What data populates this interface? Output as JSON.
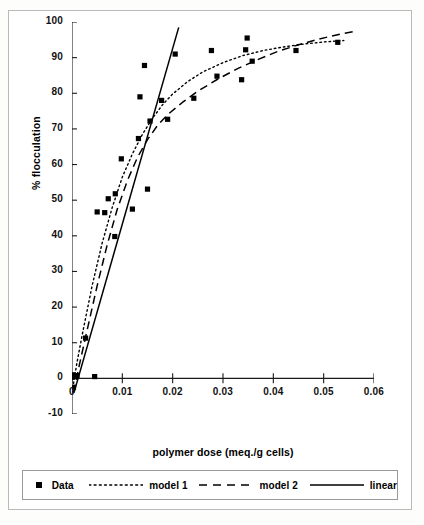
{
  "chart_data": {
    "type": "scatter",
    "title": "",
    "xlabel": "polymer dose (meq./g cells)",
    "ylabel": "% flocculation",
    "xlim": [
      0,
      0.06
    ],
    "ylim": [
      -10,
      100
    ],
    "xticks": [
      "0",
      "0.01",
      "0.02",
      "0.03",
      "0.04",
      "0.05",
      "0.06"
    ],
    "xtick_values": [
      0,
      0.01,
      0.02,
      0.03,
      0.04,
      0.05,
      0.06
    ],
    "yticks": [
      "-10",
      "0",
      "10",
      "20",
      "30",
      "40",
      "50",
      "60",
      "70",
      "80",
      "90",
      "100"
    ],
    "ytick_values": [
      -10,
      0,
      10,
      20,
      30,
      40,
      50,
      60,
      70,
      80,
      90,
      100
    ],
    "grid": false,
    "legend_position": "bottom",
    "series": [
      {
        "name": "Data",
        "type": "scatter",
        "marker": "square",
        "color": "#000000",
        "points": [
          [
            0.0,
            0.3
          ],
          [
            0.0002,
            1.0
          ],
          [
            0.0003,
            -2.5
          ],
          [
            0.001,
            0.8
          ],
          [
            0.0027,
            11.3
          ],
          [
            0.0045,
            0.5
          ],
          [
            0.005,
            46.7
          ],
          [
            0.0065,
            46.5
          ],
          [
            0.0072,
            50.4
          ],
          [
            0.0085,
            39.8
          ],
          [
            0.0086,
            51.8
          ],
          [
            0.0098,
            61.6
          ],
          [
            0.012,
            47.5
          ],
          [
            0.0132,
            67.3
          ],
          [
            0.0135,
            79.0
          ],
          [
            0.0144,
            87.8
          ],
          [
            0.015,
            53.1
          ],
          [
            0.0155,
            72.2
          ],
          [
            0.0178,
            78.0
          ],
          [
            0.019,
            72.7
          ],
          [
            0.0205,
            91.0
          ],
          [
            0.0242,
            78.6
          ],
          [
            0.0277,
            92.0
          ],
          [
            0.0288,
            84.8
          ],
          [
            0.0337,
            83.8
          ],
          [
            0.0345,
            92.2
          ],
          [
            0.0348,
            95.5
          ],
          [
            0.0358,
            89.0
          ],
          [
            0.0445,
            92.0
          ],
          [
            0.0528,
            94.3
          ]
        ]
      },
      {
        "name": "model 1",
        "type": "line",
        "style": "dotted",
        "color": "#000000",
        "points": [
          [
            0.0,
            -4.0
          ],
          [
            0.001,
            4.5
          ],
          [
            0.002,
            12.0
          ],
          [
            0.004,
            26.0
          ],
          [
            0.006,
            38.0
          ],
          [
            0.008,
            48.0
          ],
          [
            0.01,
            56.5
          ],
          [
            0.012,
            63.0
          ],
          [
            0.014,
            68.5
          ],
          [
            0.016,
            73.0
          ],
          [
            0.018,
            76.8
          ],
          [
            0.02,
            79.8
          ],
          [
            0.023,
            83.3
          ],
          [
            0.026,
            86.0
          ],
          [
            0.03,
            88.6
          ],
          [
            0.034,
            90.6
          ],
          [
            0.038,
            92.0
          ],
          [
            0.042,
            93.0
          ],
          [
            0.046,
            93.8
          ],
          [
            0.05,
            94.4
          ],
          [
            0.054,
            94.8
          ]
        ]
      },
      {
        "name": "model 2",
        "type": "line",
        "style": "dashed",
        "color": "#000000",
        "points": [
          [
            0.0003,
            -4.0
          ],
          [
            0.0015,
            4.0
          ],
          [
            0.003,
            13.5
          ],
          [
            0.005,
            26.0
          ],
          [
            0.007,
            37.5
          ],
          [
            0.009,
            47.5
          ],
          [
            0.011,
            55.5
          ],
          [
            0.013,
            62.0
          ],
          [
            0.015,
            67.0
          ],
          [
            0.017,
            71.0
          ],
          [
            0.019,
            74.0
          ],
          [
            0.022,
            77.5
          ],
          [
            0.025,
            80.6
          ],
          [
            0.029,
            84.0
          ],
          [
            0.033,
            87.0
          ],
          [
            0.037,
            89.5
          ],
          [
            0.041,
            91.8
          ],
          [
            0.045,
            93.6
          ],
          [
            0.049,
            95.2
          ],
          [
            0.053,
            96.5
          ],
          [
            0.056,
            97.3
          ]
        ]
      },
      {
        "name": "linear",
        "type": "line",
        "style": "solid",
        "color": "#000000",
        "points": [
          [
            0.0004,
            -4.0
          ],
          [
            0.0212,
            98.5
          ]
        ]
      }
    ]
  },
  "legend": {
    "entries": [
      {
        "label": "Data",
        "swatch": "square-marker"
      },
      {
        "label": "model 1",
        "swatch": "dotted-line"
      },
      {
        "label": "model 2",
        "swatch": "dashed-line"
      },
      {
        "label": "linear",
        "swatch": "solid-line"
      }
    ]
  }
}
